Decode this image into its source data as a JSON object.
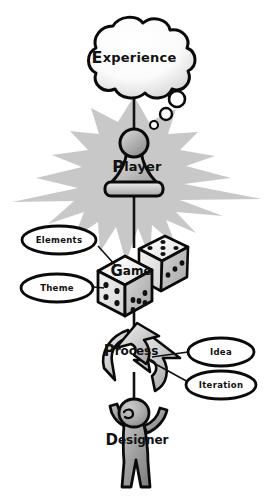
{
  "diagram": {
    "background_color": "#ffffff",
    "ink_color": "#0a0a0a",
    "burst_color": "#c8c8c8",
    "figure_color": "#9a9a9a",
    "nodes": {
      "experience": {
        "label": "Experience",
        "label_lead": "E",
        "label_rest": "xperience",
        "shape": "thought-cloud"
      },
      "player": {
        "label": "Player",
        "label_lead": "P",
        "label_rest": "layer",
        "shape": "chess-pawn"
      },
      "game": {
        "label": "Game",
        "label_lead": "G",
        "label_rest": "ame",
        "shape": "dice-pair"
      },
      "process": {
        "label": "Process",
        "label_lead": "P",
        "label_rest": "rocess",
        "shape": "cyclic-arrow"
      },
      "designer": {
        "label": "Designer",
        "label_lead": "D",
        "label_rest": "esigner",
        "shape": "human-figure"
      }
    },
    "callouts": [
      {
        "id": "elements",
        "label": "Elements",
        "side": "left"
      },
      {
        "id": "theme",
        "label": "Theme",
        "side": "left"
      },
      {
        "id": "idea",
        "label": "Idea",
        "side": "right"
      },
      {
        "id": "iteration",
        "label": "Iteration",
        "side": "right"
      }
    ],
    "dice": {
      "front_top_face_label": "Game",
      "front_left_pips": 4,
      "front_right_pips": 5,
      "back_top_pips": 5,
      "back_right_pips": 3
    }
  }
}
